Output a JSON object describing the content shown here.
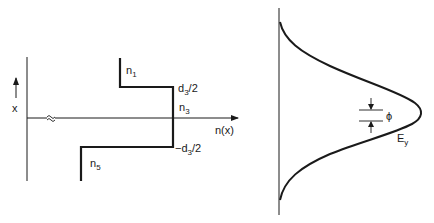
{
  "left_panel": {
    "vertical_axis_label": "x",
    "horizontal_axis_label": "n(x)",
    "axis_break_symbol": "≈",
    "regions": [
      {
        "name": "n",
        "sub": "1"
      },
      {
        "name": "n",
        "sub": "3"
      },
      {
        "name": "n",
        "sub": "5"
      }
    ],
    "boundaries": {
      "upper": {
        "prefix": "d",
        "sub": "3",
        "suffix": "/2"
      },
      "lower": {
        "prefix": "−d",
        "sub": "3",
        "suffix": "/2"
      }
    }
  },
  "right_panel": {
    "field_label": {
      "name": "E",
      "sub": "y"
    },
    "offset_label": "ϕ"
  },
  "colors": {
    "ink": "#1a1a1a",
    "background": "#ffffff"
  }
}
